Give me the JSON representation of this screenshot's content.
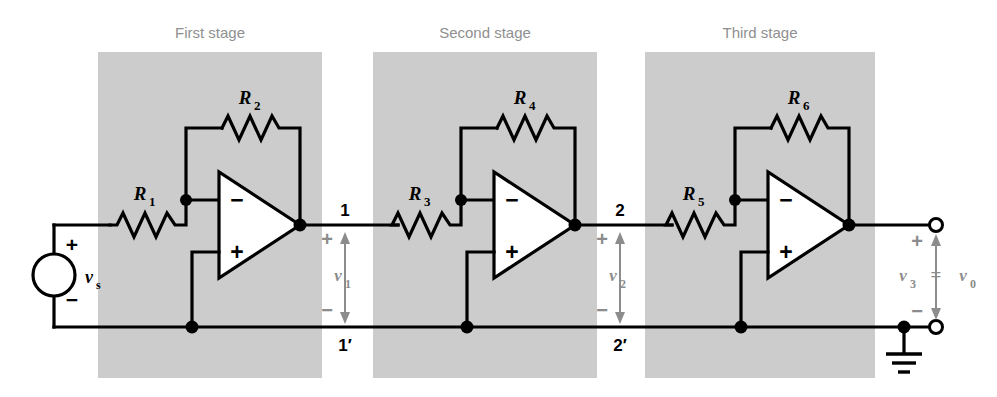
{
  "figure": {
    "width": 997,
    "height": 397,
    "panel_color": "#cccccc",
    "wire_color": "#000000",
    "annotation_color": "#8c8c8c"
  },
  "stages": [
    {
      "title": "First stage",
      "input_resistor": "R",
      "input_sub": "1",
      "feedback_resistor": "R",
      "feedback_sub": "2"
    },
    {
      "title": "Second stage",
      "input_resistor": "R",
      "input_sub": "3",
      "feedback_resistor": "R",
      "feedback_sub": "4"
    },
    {
      "title": "Third stage",
      "input_resistor": "R",
      "input_sub": "5",
      "feedback_resistor": "R",
      "feedback_sub": "6"
    }
  ],
  "source": {
    "symbol": "v",
    "subscript": "s",
    "plus": "+",
    "minus": "−"
  },
  "opamp": {
    "inverting_sign": "−",
    "noninverting_sign": "+"
  },
  "nodes": {
    "n1_top": "1",
    "n1_bottom": "1′",
    "n2_top": "2",
    "n2_bottom": "2′"
  },
  "voltages": [
    {
      "symbol": "v",
      "subscript": "1",
      "plus": "+",
      "minus": "−"
    },
    {
      "symbol": "v",
      "subscript": "2",
      "plus": "+",
      "minus": "−"
    }
  ],
  "output": {
    "symbol_left": "v",
    "sub_left": "3",
    "equals": "=",
    "symbol_right": "v",
    "sub_right": "0",
    "plus": "+",
    "minus": "−"
  },
  "ground": {
    "name": "ground-symbol"
  }
}
